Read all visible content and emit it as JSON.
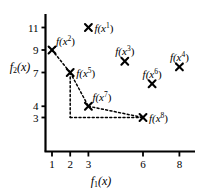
{
  "chart_data": {
    "type": "scatter",
    "title": "",
    "xlabel": "f_1(x)",
    "ylabel": "f_2(x)",
    "xlabel_display": "f",
    "xlabel_sub": "1",
    "xlabel_arg": "(x)",
    "ylabel_display": "f",
    "ylabel_sub": "2",
    "ylabel_arg": "(x)",
    "xticks": [
      1,
      2,
      3,
      6,
      8
    ],
    "xtick_labels": [
      "1",
      "2",
      "3",
      "6",
      "8"
    ],
    "yticks": [
      3,
      4,
      7,
      9,
      11
    ],
    "ytick_labels": [
      "3",
      "4",
      "7",
      "9",
      "11"
    ],
    "xlim": [
      0,
      9.6
    ],
    "ylim": [
      0,
      12.2
    ],
    "grid": false,
    "legend": "none",
    "marker": "x",
    "points": [
      {
        "id": "1",
        "label": "f(x",
        "sup": "1",
        "label_end": ")",
        "x": 3,
        "y": 11,
        "label_side": "right"
      },
      {
        "id": "2",
        "label": "f(x",
        "sup": "2",
        "label_end": ")",
        "x": 1,
        "y": 9,
        "label_side": "upper-right"
      },
      {
        "id": "3",
        "label": "f(x",
        "sup": "3",
        "label_end": ")",
        "x": 5,
        "y": 8,
        "label_side": "above"
      },
      {
        "id": "4",
        "label": "f(x",
        "sup": "4",
        "label_end": ")",
        "x": 8,
        "y": 7.5,
        "label_side": "above"
      },
      {
        "id": "5",
        "label": "f(x",
        "sup": "5",
        "label_end": ")",
        "x": 2,
        "y": 7,
        "label_side": "right"
      },
      {
        "id": "6",
        "label": "f(x",
        "sup": "6",
        "label_end": ")",
        "x": 6.5,
        "y": 6,
        "label_side": "above"
      },
      {
        "id": "7",
        "label": "f(x",
        "sup": "7",
        "label_end": ")",
        "x": 3,
        "y": 4,
        "label_side": "upper-right"
      },
      {
        "id": "8",
        "label": "f(x",
        "sup": "8",
        "label_end": ")",
        "x": 6,
        "y": 3,
        "label_side": "right"
      }
    ],
    "pareto_front_points": [
      "2",
      "5",
      "7",
      "8"
    ],
    "front_style": "dotted",
    "staircase_style": "dotted",
    "colors": {
      "axis": "#000000",
      "marker": "#000000",
      "front": "#000000",
      "background": "#ffffff"
    }
  }
}
